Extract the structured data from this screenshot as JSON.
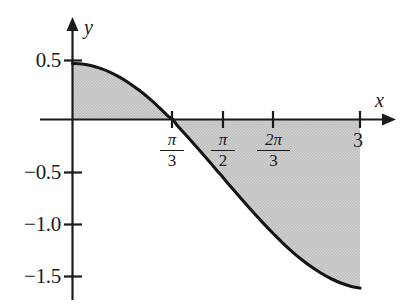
{
  "figure": {
    "kind": "cartesian-plot",
    "background_color": "#ffffff",
    "curve_color": "#141414",
    "axis_color": "#1a1a1a",
    "shade_color": "#c9c9c9"
  },
  "axes": {
    "x_axis_label": "x",
    "y_axis_label": "y",
    "x_ticks": [
      {
        "id": "pi-over-3",
        "numerator": "π",
        "denominator": "3",
        "value": 1.0472
      },
      {
        "id": "pi-over-2",
        "numerator": "π",
        "denominator": "2",
        "value": 1.5708
      },
      {
        "id": "two-pi-over-3",
        "numerator": "2π",
        "denominator": "3",
        "value": 2.0944
      },
      {
        "id": "three",
        "label": "3",
        "value": 3
      }
    ],
    "y_ticks": [
      {
        "label": "0.5",
        "value": 0.5
      },
      {
        "label": "−0.5",
        "value": -0.5
      },
      {
        "label": "−1.0",
        "value": -1.0
      },
      {
        "label": "−1.5",
        "value": -1.5
      }
    ],
    "xlim": [
      0,
      3.25
    ],
    "ylim": [
      -1.75,
      0.7
    ],
    "grid": false
  },
  "chart_data": {
    "type": "line",
    "title": "",
    "subtitle": "",
    "xlabel": "x",
    "ylabel": "y",
    "xlim": [
      0,
      3.25
    ],
    "ylim": [
      -1.75,
      0.7
    ],
    "grid": false,
    "legend": null,
    "xticks": [
      {
        "value": 1.0472,
        "label": "π/3"
      },
      {
        "value": 1.5708,
        "label": "π/2"
      },
      {
        "value": 2.0944,
        "label": "2π/3"
      },
      {
        "value": 3,
        "label": "3"
      }
    ],
    "yticks": [
      {
        "value": 0.5,
        "label": "0.5"
      },
      {
        "value": -0.5,
        "label": "−0.5"
      },
      {
        "value": -1.0,
        "label": "−1.0"
      },
      {
        "value": -1.5,
        "label": "−1.5"
      }
    ],
    "series": [
      {
        "name": "curve",
        "x": [
          0.0,
          0.1,
          0.2,
          0.3,
          0.4,
          0.5,
          0.6,
          0.7,
          0.8,
          0.9,
          1.0,
          1.0472,
          1.1,
          1.2,
          1.3,
          1.4,
          1.5,
          1.5708,
          1.6,
          1.7,
          1.8,
          1.9,
          2.0,
          2.0944,
          2.2,
          2.3,
          2.4,
          2.5,
          2.6,
          2.7,
          2.8,
          2.9,
          3.0
        ],
        "y": [
          0.5,
          0.495,
          0.48,
          0.454,
          0.419,
          0.374,
          0.32,
          0.258,
          0.188,
          0.111,
          0.028,
          0.0,
          -0.061,
          -0.154,
          -0.25,
          -0.348,
          -0.448,
          -0.517,
          -0.548,
          -0.648,
          -0.746,
          -0.842,
          -0.934,
          -1.018,
          -1.108,
          -1.186,
          -1.257,
          -1.32,
          -1.375,
          -1.422,
          -1.46,
          -1.488,
          -1.505
        ]
      }
    ],
    "shaded_regions": [
      {
        "name": "region-above-axis",
        "x_from": 0,
        "x_to": 1.0472,
        "between": "curve and x-axis",
        "sign": "positive"
      },
      {
        "name": "region-below-axis",
        "x_from": 1.0472,
        "x_to": 3,
        "between": "curve and x-axis",
        "sign": "negative"
      }
    ],
    "annotations": []
  }
}
